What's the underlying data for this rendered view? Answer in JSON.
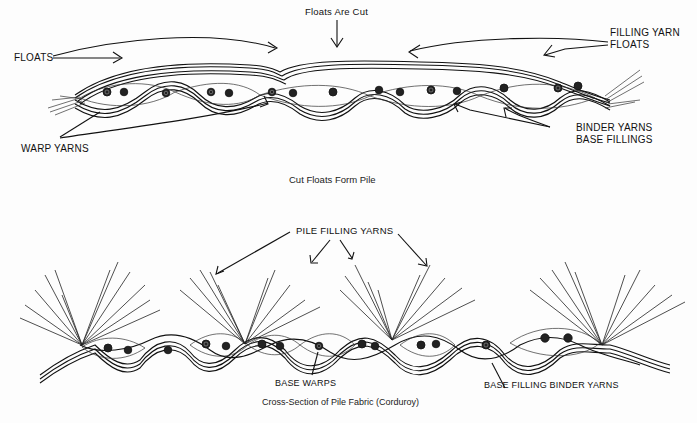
{
  "diagram": {
    "top": {
      "title_arrow_label": "Floats Are Cut",
      "labels": {
        "floats": "FLOATS",
        "filling_yarn_floats_line1": "FILLING YARN",
        "filling_yarn_floats_line2": "FLOATS",
        "warp_yarns": "WARP YARNS",
        "binder_yarns": "BINDER YARNS",
        "base_fillings": "BASE FILLINGS"
      },
      "caption": "Cut Floats Form Pile"
    },
    "bottom": {
      "labels": {
        "pile_filling_yarns": "PILE FILLING YARNS",
        "base_warps": "BASE WARPS",
        "base_filling_binder_yarns": "BASE FILLING BINDER YARNS"
      },
      "caption": "Cross-Section of Pile Fabric (Corduroy)"
    }
  }
}
